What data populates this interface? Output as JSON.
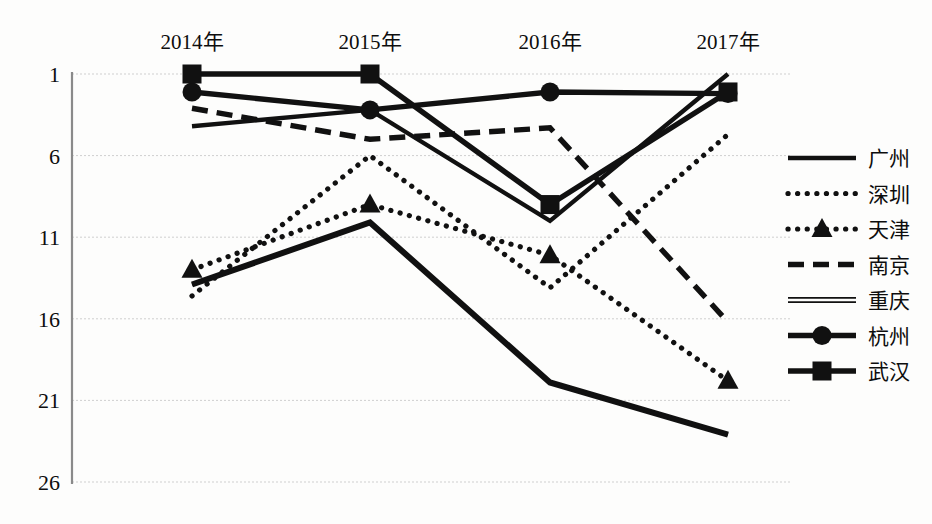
{
  "chart_data": {
    "type": "line",
    "title": "",
    "subtitle": "",
    "xlabel": "",
    "ylabel": "",
    "categories": [
      "2014年",
      "2015年",
      "2016年",
      "2017年"
    ],
    "y_ticks": [
      1,
      6,
      11,
      16,
      21,
      26
    ],
    "ylim": [
      1,
      26
    ],
    "y_inverted": true,
    "grid": true,
    "legend_position": "right",
    "note": "Y axis is a rank axis: 1 is best and plotted at the top.",
    "series": [
      {
        "name": "广州",
        "style": "solid",
        "marker": "none",
        "values": [
          4.2,
          3.2,
          10.0,
          1.0
        ]
      },
      {
        "name": "深圳",
        "style": "dotted",
        "marker": "none",
        "values": [
          14.6,
          6.0,
          14.1,
          4.7
        ]
      },
      {
        "name": "天津",
        "style": "dotted",
        "marker": "triangle",
        "values": [
          13.0,
          9.0,
          12.1,
          19.8
        ]
      },
      {
        "name": "南京",
        "style": "dashed",
        "marker": "none",
        "values": [
          3.1,
          5.0,
          4.3,
          16.2
        ]
      },
      {
        "name": "重庆",
        "style": "double",
        "marker": "none",
        "values": [
          13.9,
          10.1,
          19.9,
          23.1
        ]
      },
      {
        "name": "杭州",
        "style": "solid-marker",
        "marker": "circle",
        "values": [
          2.1,
          3.2,
          2.1,
          2.2
        ]
      },
      {
        "name": "武汉",
        "style": "solid-marker",
        "marker": "square",
        "values": [
          1.0,
          1.0,
          9.0,
          2.1
        ]
      }
    ]
  },
  "legend": {
    "items": [
      {
        "label": "广州",
        "key": "guangzhou"
      },
      {
        "label": "深圳",
        "key": "shenzhen"
      },
      {
        "label": "天津",
        "key": "tianjin"
      },
      {
        "label": "南京",
        "key": "nanjing"
      },
      {
        "label": "重庆",
        "key": "chongqing"
      },
      {
        "label": "杭州",
        "key": "hangzhou"
      },
      {
        "label": "武汉",
        "key": "wuhan"
      }
    ]
  },
  "colors": {
    "ink": "#111111",
    "grid": "#cfcfcf",
    "axis": "#8a8a8a",
    "background": "#fdfdfc"
  }
}
